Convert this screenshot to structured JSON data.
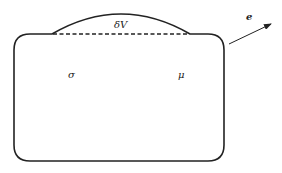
{
  "diagram": {
    "labels": {
      "bump": "δV",
      "left_region": "σ",
      "right_region": "μ",
      "vector": "e"
    },
    "colors": {
      "stroke": "#222222",
      "background": "#ffffff"
    }
  }
}
